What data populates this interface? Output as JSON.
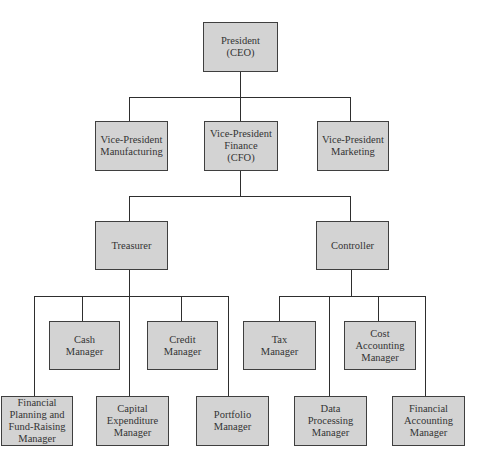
{
  "diagram": {
    "type": "organization-chart",
    "colors": {
      "box_fill": "#d3d3d3",
      "box_border": "#3f3f3f",
      "connector": "#2e2e2e",
      "text": "#333333"
    },
    "nodes": {
      "president": {
        "label": "President\n(CEO)"
      },
      "vp_manufacturing": {
        "label": "Vice-President\nManufacturing"
      },
      "vp_finance": {
        "label": "Vice-President\nFinance\n(CFO)"
      },
      "vp_marketing": {
        "label": "Vice-President\nMarketing"
      },
      "treasurer": {
        "label": "Treasurer"
      },
      "controller": {
        "label": "Controller"
      },
      "cash_manager": {
        "label": "Cash\nManager"
      },
      "credit_manager": {
        "label": "Credit\nManager"
      },
      "financial_planning_manager": {
        "label": "Financial\nPlanning and\nFund-Raising\nManager"
      },
      "capital_expenditure_manager": {
        "label": "Capital\nExpenditure\nManager"
      },
      "portfolio_manager": {
        "label": "Portfolio\nManager"
      },
      "tax_manager": {
        "label": "Tax\nManager"
      },
      "cost_accounting_manager": {
        "label": "Cost\nAccounting\nManager"
      },
      "data_processing_manager": {
        "label": "Data\nProcessing\nManager"
      },
      "financial_accounting_manager": {
        "label": "Financial\nAccounting\nManager"
      }
    },
    "edges": [
      [
        "president",
        "vp_manufacturing"
      ],
      [
        "president",
        "vp_finance"
      ],
      [
        "president",
        "vp_marketing"
      ],
      [
        "vp_finance",
        "treasurer"
      ],
      [
        "vp_finance",
        "controller"
      ],
      [
        "treasurer",
        "cash_manager"
      ],
      [
        "treasurer",
        "credit_manager"
      ],
      [
        "treasurer",
        "financial_planning_manager"
      ],
      [
        "treasurer",
        "capital_expenditure_manager"
      ],
      [
        "treasurer",
        "portfolio_manager"
      ],
      [
        "controller",
        "tax_manager"
      ],
      [
        "controller",
        "cost_accounting_manager"
      ],
      [
        "controller",
        "data_processing_manager"
      ],
      [
        "controller",
        "financial_accounting_manager"
      ]
    ]
  }
}
